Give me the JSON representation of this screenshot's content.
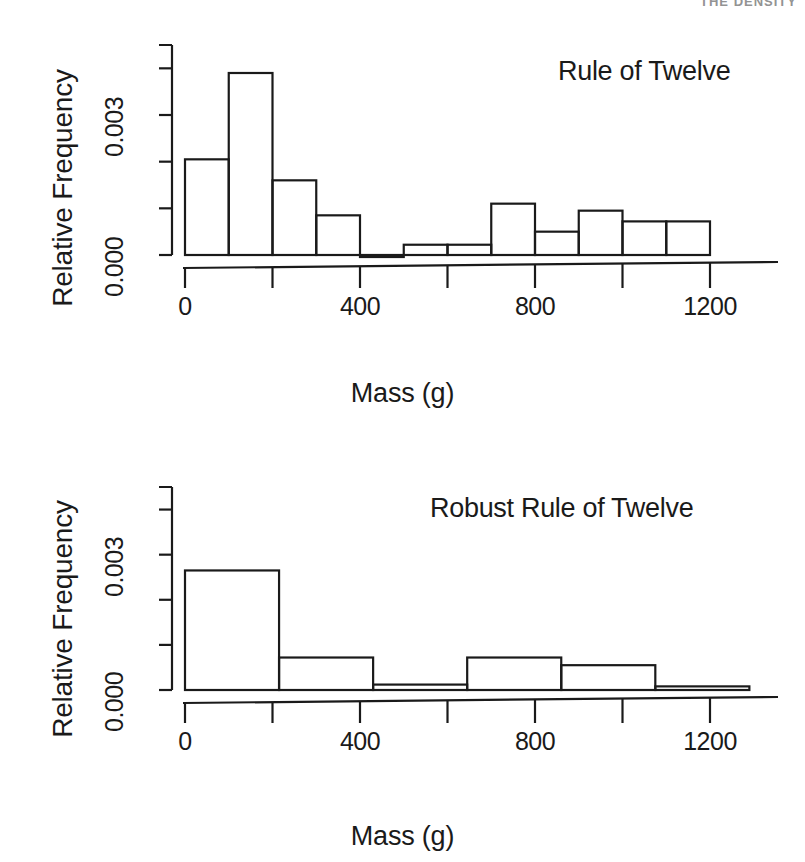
{
  "page": {
    "cut_off_header": "THE DENSITY",
    "background": "#ffffff",
    "ink": "#1a1a1a"
  },
  "panels": [
    {
      "id": "rule-of-twelve",
      "title": "Rule of Twelve",
      "ylabel": "Relative Frequency",
      "xlabel": "Mass (g)"
    },
    {
      "id": "robust-rule-of-twelve",
      "title": "Robust Rule of Twelve",
      "ylabel": "Relative Frequency",
      "xlabel": "Mass (g)"
    }
  ],
  "chart_data": [
    {
      "type": "bar",
      "id": "rule-of-twelve",
      "title": "Rule of Twelve",
      "xlabel": "Mass (g)",
      "ylabel": "Relative Frequency",
      "grid": false,
      "legend": null,
      "xlim": [
        0,
        1400
      ],
      "ylim": [
        0,
        0.0045
      ],
      "xticks": [
        0,
        200,
        400,
        600,
        800,
        1000,
        1200
      ],
      "xtick_labels": [
        "0",
        "",
        "400",
        "",
        "800",
        "",
        "1200"
      ],
      "yticks": [
        0.0,
        0.001,
        0.002,
        0.003,
        0.004
      ],
      "ytick_labels": [
        "0.000",
        "",
        "",
        "0.003",
        ""
      ],
      "bin_edges": [
        0,
        100,
        200,
        300,
        400,
        500,
        600,
        700,
        800,
        900,
        1000,
        1100
      ],
      "values": [
        0.00205,
        0.0039,
        0.0016,
        0.00085,
        0.0,
        0.00022,
        0.00022,
        0.0011,
        0.0005,
        0.00095,
        0.00072,
        0.00072
      ]
    },
    {
      "type": "bar",
      "id": "robust-rule-of-twelve",
      "title": "Robust Rule of Twelve",
      "xlabel": "Mass (g)",
      "ylabel": "Relative Frequency",
      "grid": false,
      "legend": null,
      "xlim": [
        0,
        1400
      ],
      "ylim": [
        0,
        0.0045
      ],
      "xticks": [
        0,
        200,
        400,
        600,
        800,
        1000,
        1200
      ],
      "xtick_labels": [
        "0",
        "",
        "400",
        "",
        "800",
        "",
        "1200"
      ],
      "yticks": [
        0.0,
        0.001,
        0.002,
        0.003,
        0.004
      ],
      "ytick_labels": [
        "0.000",
        "",
        "",
        "0.003",
        ""
      ],
      "bin_edges": [
        0,
        215,
        430,
        645,
        860,
        1075,
        1290
      ],
      "values": [
        0.00265,
        0.00072,
        0.00012,
        0.00072,
        0.00055,
        8e-05
      ]
    }
  ]
}
